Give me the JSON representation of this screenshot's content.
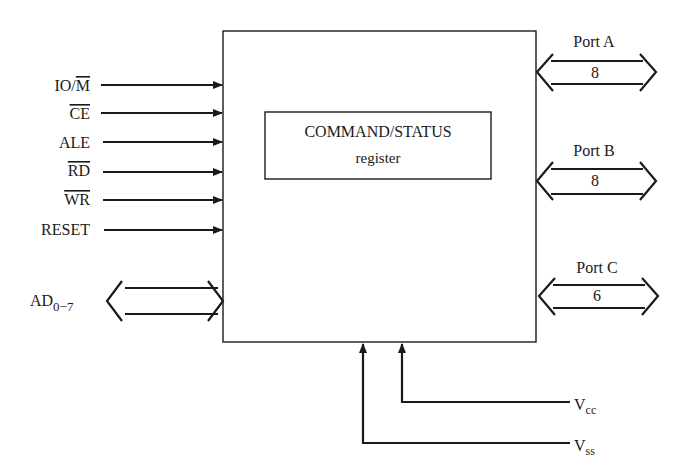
{
  "diagram": {
    "chip_box": {
      "inner_register": {
        "line1": "COMMAND/STATUS",
        "line2": "register"
      }
    },
    "inputs": [
      {
        "label": "IO/M",
        "overbar": "M",
        "prefix": "IO/",
        "direction": "in"
      },
      {
        "label": "CE",
        "overbar": "CE",
        "direction": "in"
      },
      {
        "label": "ALE",
        "direction": "in"
      },
      {
        "label": "RD",
        "overbar": "RD",
        "direction": "in"
      },
      {
        "label": "WR",
        "overbar": "WR",
        "direction": "in"
      },
      {
        "label": "RESET",
        "direction": "in"
      }
    ],
    "bus": {
      "label": "AD",
      "subscript": "0−7",
      "direction": "bidirectional"
    },
    "ports": [
      {
        "name": "Port A",
        "width": "8"
      },
      {
        "name": "Port B",
        "width": "8"
      },
      {
        "name": "Port C",
        "width": "6"
      }
    ],
    "power": [
      {
        "label": "V",
        "subscript": "cc"
      },
      {
        "label": "V",
        "subscript": "ss"
      }
    ],
    "colors": {
      "ink": "#1a1a1a",
      "background": "#ffffff"
    }
  }
}
